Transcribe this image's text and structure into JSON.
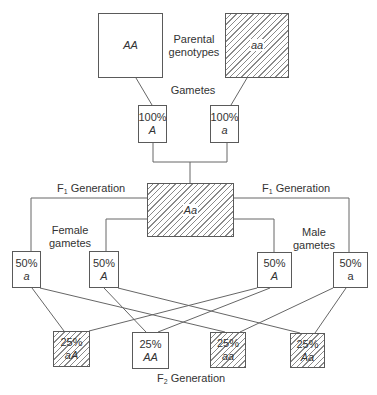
{
  "diagram": {
    "labels": {
      "parental_genotypes": "Parental genotypes",
      "parental_line1": "Parental",
      "parental_line2": "genotypes",
      "gametes": "Gametes",
      "f1_left": "Generation",
      "f1_right": "Generation",
      "f1_prefix": "F",
      "f1_sub": "1",
      "female_line1": "Female",
      "female_line2": "gametes",
      "male_line1": "Male",
      "male_line2": "gametes",
      "f2_prefix": "F",
      "f2_sub": "2",
      "f2_text": "Generation"
    },
    "parents": [
      {
        "genotype": "AA",
        "hatched": false
      },
      {
        "genotype": "aa",
        "hatched": true
      }
    ],
    "parent_gametes": [
      {
        "percent": "100%",
        "allele": "A"
      },
      {
        "percent": "100%",
        "allele": "a"
      }
    ],
    "f1": {
      "genotype": "Aa",
      "hatched": true
    },
    "female_gametes": [
      {
        "percent": "50%",
        "allele": "a"
      },
      {
        "percent": "50%",
        "allele": "A"
      }
    ],
    "male_gametes": [
      {
        "percent": "50%",
        "allele": "A"
      },
      {
        "percent": "50%",
        "allele": "a"
      }
    ],
    "f2": [
      {
        "percent": "25%",
        "genotype": "aA",
        "hatched": true
      },
      {
        "percent": "25%",
        "genotype": "AA",
        "hatched": false
      },
      {
        "percent": "25%",
        "genotype": "aa",
        "hatched": true
      },
      {
        "percent": "25%",
        "genotype": "Aa",
        "hatched": true
      }
    ]
  }
}
